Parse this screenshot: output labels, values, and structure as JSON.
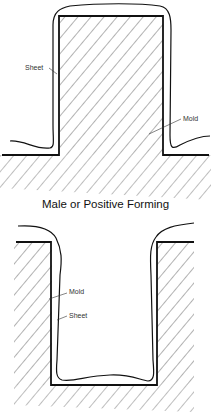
{
  "diagrams": [
    {
      "name": "male-forming",
      "caption": "Male or Positive Forming",
      "labels": {
        "sheet": "Sheet",
        "mold": "Mold"
      }
    },
    {
      "name": "female-forming",
      "caption": "",
      "labels": {
        "mold": "Mold",
        "sheet": "Sheet"
      }
    }
  ],
  "colors": {
    "line": "#111111",
    "hatch": "#555555",
    "background": "#ffffff"
  }
}
